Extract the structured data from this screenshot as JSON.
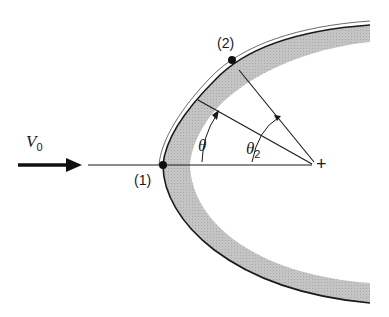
{
  "diagram": {
    "labels": {
      "velocity": "V",
      "velocity_sub": "0",
      "point1": "(1)",
      "point2": "(2)",
      "theta": "θ",
      "theta2": "θ",
      "theta2_sub": "2",
      "center_mark": "+"
    },
    "colors": {
      "line": "#1a1a1a",
      "band": "#bdbdbd",
      "background": "#ffffff"
    }
  }
}
